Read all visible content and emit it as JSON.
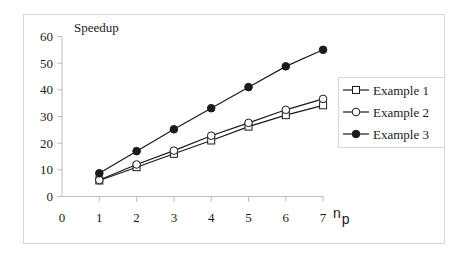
{
  "chart_data": {
    "type": "line",
    "title": "Speedup",
    "xlabel": "n_p",
    "xlabel_main": "n",
    "xlabel_sub": "p",
    "ylabel": "Speedup",
    "x": [
      1,
      2,
      3,
      4,
      5,
      6,
      7
    ],
    "xlim": [
      0,
      7
    ],
    "ylim": [
      0,
      60
    ],
    "xticks": [
      "0",
      "1",
      "2",
      "3",
      "4",
      "5",
      "6",
      "7"
    ],
    "yticks": [
      "0",
      "10",
      "20",
      "30",
      "40",
      "50",
      "60"
    ],
    "grid": false,
    "legend_position": "right",
    "series": [
      {
        "name": "Example 1",
        "marker": "square-open",
        "values": [
          6,
          11,
          16,
          21,
          26.2,
          30.5,
          34.2
        ]
      },
      {
        "name": "Example 2",
        "marker": "circle-open",
        "values": [
          6.2,
          12,
          17.2,
          22.8,
          27.6,
          32.5,
          36.6
        ]
      },
      {
        "name": "Example 3",
        "marker": "circle-filled",
        "values": [
          8.7,
          17,
          25.2,
          33.1,
          41,
          48.8,
          55
        ]
      }
    ]
  },
  "colors": {
    "line": "#1a1a1a",
    "axis": "#bdbdbd",
    "frame": "#d6d6d6"
  }
}
